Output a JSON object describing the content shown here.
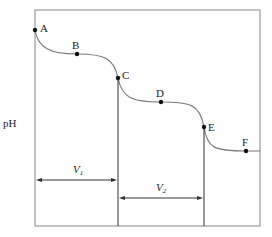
{
  "diagram": {
    "ylabel": "pH",
    "points": [
      {
        "label": "A",
        "x": 35,
        "y": 30
      },
      {
        "label": "B",
        "x": 77,
        "y": 54
      },
      {
        "label": "C",
        "x": 118,
        "y": 78
      },
      {
        "label": "D",
        "x": 161,
        "y": 102
      },
      {
        "label": "E",
        "x": 204,
        "y": 127
      },
      {
        "label": "F",
        "x": 246,
        "y": 151
      }
    ],
    "intervals": [
      {
        "label": "V",
        "sub": "1"
      },
      {
        "label": "V",
        "sub": "2"
      }
    ],
    "colors": {
      "curve": "#7a7a7a",
      "frame": "#9a9a9a",
      "line": "#333333",
      "point": "#111111"
    }
  }
}
